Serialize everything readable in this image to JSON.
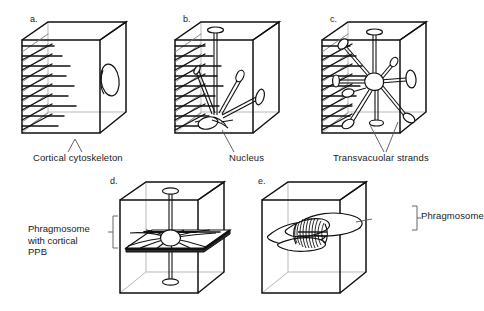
{
  "figure": {
    "type": "diagram",
    "background_color": "#ffffff",
    "line_color": "#111111",
    "hidden_edge_color": "#b9b9b9",
    "plate_fill_color": "#2b2b2b"
  },
  "panels": [
    {
      "id": "a",
      "letter": "a.",
      "description": "Cube with cortical cytoskeleton microtubules on the left face and a single lens-shaped nucleus on the right face",
      "contents": [
        "cortical-microtubule-array",
        "nucleus-lens"
      ]
    },
    {
      "id": "b",
      "letter": "b.",
      "description": "Cube with cortical array on left face and a nucleus at the cell floor with a few transvacuolar strands radiating upward and outward",
      "contents": [
        "cortical-microtubule-array",
        "nucleus",
        "transvacuolar-strands"
      ]
    },
    {
      "id": "c",
      "letter": "c.",
      "description": "Cube with cortical array and a centrally suspended nucleus held by many transvacuolar strands anchored to all walls",
      "contents": [
        "cortical-microtubule-array",
        "central-nucleus",
        "transvacuolar-strands"
      ]
    },
    {
      "id": "d",
      "letter": "d.",
      "description": "Cube containing a flat transverse phragmosome plate with radiating strands from a central nucleus, plus cortical preprophase band at the plate margins",
      "contents": [
        "phragmosome-plate",
        "nucleus",
        "radiating-strands",
        "preprophase-band"
      ]
    },
    {
      "id": "e",
      "letter": "e.",
      "description": "Cube containing a mitotic spindle with barrel-shaped microtubule bundles lying within the phragmosome plane",
      "contents": [
        "mitotic-spindle",
        "phragmosome-plane"
      ]
    }
  ],
  "captions": {
    "cortical_cytoskeleton": "Cortical cytoskeleton",
    "nucleus": "Nucleus",
    "transvacuolar_strands": "Transvacuolar strands",
    "phragmosome_with_cortical_ppb_line1": "Phragmosome",
    "phragmosome_with_cortical_ppb_line2": "with cortical",
    "phragmosome_with_cortical_ppb_line3": "PPB",
    "phragmosome": "Phragmosome"
  }
}
